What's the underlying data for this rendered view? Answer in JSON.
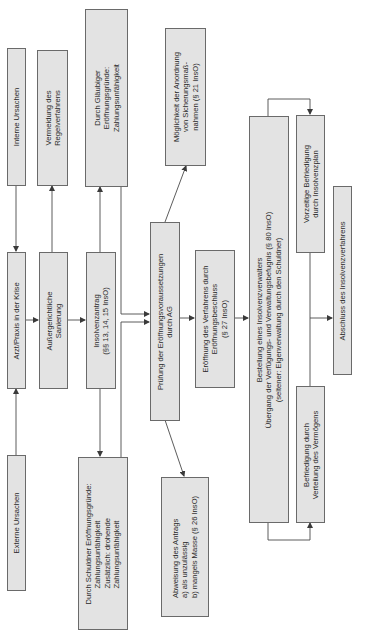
{
  "diagram": {
    "orientation": "rotated-90-ccw",
    "colors": {
      "box_fill": "#e3e3e3",
      "box_border": "#6a6a6a",
      "line": "#4a4a4a",
      "text": "#2a2a2a"
    },
    "nodes": {
      "interne_ursachen": {
        "lines": [
          "Interne Ursachen"
        ]
      },
      "vermeidung": {
        "lines": [
          "Vermeidung des",
          "Regelverfahrens"
        ]
      },
      "glaeubiger": {
        "lines": [
          "Durch Gläubiger",
          "Eröffnungsgründe:",
          "Zahlungsunfähigkeit"
        ]
      },
      "sicherung": {
        "lines": [
          "Möglichkeit der Anordnung",
          "von Sicherungsmaß-",
          "nahmen (§ 21 InsO)"
        ]
      },
      "arzt": {
        "lines": [
          "Arzt/Praxis in der Krise"
        ]
      },
      "sanierung": {
        "lines": [
          "Außergerichtliche",
          "Sanierung"
        ]
      },
      "antrag": {
        "lines": [
          "Insolvenzantrag",
          "(§§ 13, 14, 15 InsO)"
        ]
      },
      "pruefung": {
        "lines": [
          "Prüfung der Eröffnungsvoraussetzungen",
          "durch AG"
        ]
      },
      "eroeffnung": {
        "lines": [
          "Eröffnung des Verfahrens durch",
          "Eröffnungsbeschluss",
          "(§ 27 InsO)"
        ]
      },
      "bestellung": {
        "lines": [
          "Bestellung eines Insolvenzverwalters",
          "Übergang der Verfügungs- und Verwaltungsbefugnis (§ 80 InsO)",
          "(seltener: Eigenverwaltung durch den Schuldner)"
        ]
      },
      "vorzeitig": {
        "lines": [
          "Vorzeitige Befriedigung",
          "durch Insolvenzplan"
        ]
      },
      "abschluss": {
        "lines": [
          "Abschluss des Insolvenzverfahrens"
        ]
      },
      "verteilung": {
        "lines": [
          "Befriedigung durch",
          "Verteilung des Vermögens"
        ]
      },
      "externe_ursachen": {
        "lines": [
          "Externe Ursachen"
        ]
      },
      "schuldner": {
        "lines": [
          "Durch Schuldner Eröffnungsgründe:",
          "Zahlungsunfähigkeit",
          "Zusätzlich: drohende",
          "Zahlungsunfähigkeit"
        ]
      },
      "abweisung": {
        "lines": [
          "Abweisung des Antrags",
          "a)  als unzulässig",
          "b)  mangels Masse (§ 26 InsO)"
        ]
      }
    },
    "edges": [
      {
        "from": "interne_ursachen",
        "to": "arzt"
      },
      {
        "from": "externe_ursachen",
        "to": "arzt"
      },
      {
        "from": "arzt",
        "to": "sanierung"
      },
      {
        "from": "sanierung",
        "to": "vermeidung"
      },
      {
        "from": "sanierung",
        "to": "antrag"
      },
      {
        "from": "antrag",
        "to": "glaeubiger"
      },
      {
        "from": "antrag",
        "to": "schuldner"
      },
      {
        "from": "glaeubiger",
        "to": "pruefung"
      },
      {
        "from": "schuldner",
        "to": "pruefung"
      },
      {
        "from": "pruefung",
        "to": "sicherung"
      },
      {
        "from": "pruefung",
        "to": "abweisung"
      },
      {
        "from": "pruefung",
        "to": "eroeffnung"
      },
      {
        "from": "eroeffnung",
        "to": "bestellung"
      },
      {
        "from": "bestellung",
        "to": "vorzeitig"
      },
      {
        "from": "bestellung",
        "to": "verteilung"
      },
      {
        "from": "vorzeitig",
        "to": "abschluss"
      },
      {
        "from": "verteilung",
        "to": "abschluss"
      }
    ]
  }
}
